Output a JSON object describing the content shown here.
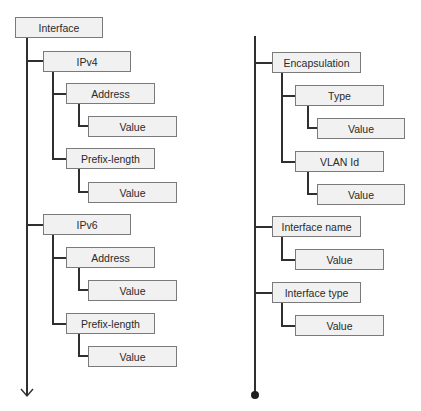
{
  "diagram": {
    "type": "tree",
    "left_column": {
      "root": "Interface",
      "continuation": "arrow-down",
      "nodes": [
        {
          "id": "interface",
          "label": "Interface",
          "level": 0,
          "x": 15,
          "y": 17
        },
        {
          "id": "ipv4",
          "label": "IPv4",
          "level": 1,
          "x": 43,
          "y": 51
        },
        {
          "id": "ipv4-address",
          "label": "Address",
          "level": 2,
          "x": 66,
          "y": 83
        },
        {
          "id": "ipv4-address-value",
          "label": "Value",
          "level": 3,
          "x": 88,
          "y": 116
        },
        {
          "id": "ipv4-prefix",
          "label": "Prefix-length",
          "level": 2,
          "x": 66,
          "y": 148
        },
        {
          "id": "ipv4-prefix-value",
          "label": "Value",
          "level": 3,
          "x": 88,
          "y": 182
        },
        {
          "id": "ipv6",
          "label": "IPv6",
          "level": 1,
          "x": 43,
          "y": 214
        },
        {
          "id": "ipv6-address",
          "label": "Address",
          "level": 2,
          "x": 66,
          "y": 247
        },
        {
          "id": "ipv6-address-value",
          "label": "Value",
          "level": 3,
          "x": 88,
          "y": 280
        },
        {
          "id": "ipv6-prefix",
          "label": "Prefix-length",
          "level": 2,
          "x": 66,
          "y": 313
        },
        {
          "id": "ipv6-prefix-value",
          "label": "Value",
          "level": 3,
          "x": 88,
          "y": 346
        }
      ]
    },
    "right_column": {
      "continuation": "dot-end",
      "nodes": [
        {
          "id": "encapsulation",
          "label": "Encapsulation",
          "level": 1,
          "x": 272,
          "y": 52
        },
        {
          "id": "encap-type",
          "label": "Type",
          "level": 2,
          "x": 295,
          "y": 85
        },
        {
          "id": "encap-type-value",
          "label": "Value",
          "level": 3,
          "x": 317,
          "y": 118
        },
        {
          "id": "encap-vlan",
          "label": "VLAN Id",
          "level": 2,
          "x": 295,
          "y": 151
        },
        {
          "id": "encap-vlan-value",
          "label": "Value",
          "level": 3,
          "x": 317,
          "y": 184
        },
        {
          "id": "interface-name",
          "label": "Interface name",
          "level": 1,
          "x": 272,
          "y": 216
        },
        {
          "id": "interface-name-value",
          "label": "Value",
          "level": 2,
          "x": 295,
          "y": 249
        },
        {
          "id": "interface-type",
          "label": "Interface type",
          "level": 1,
          "x": 272,
          "y": 282
        },
        {
          "id": "interface-type-value",
          "label": "Value",
          "level": 2,
          "x": 295,
          "y": 315
        }
      ]
    },
    "colors": {
      "node_fill": "#f1f1f1",
      "node_border": "#7a7a7a",
      "connector": "#2f2f2f",
      "text": "#2a2a2a"
    }
  }
}
